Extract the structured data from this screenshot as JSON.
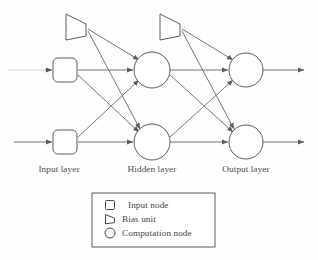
{
  "diagram": {
    "background_color": "#fefefe",
    "stroke_color": "#5c5c5c",
    "faint_stroke_color": "#c9c9c9",
    "layer_labels": [
      {
        "id": "input-layer",
        "text": "Input layer",
        "x": 59,
        "y": 172
      },
      {
        "id": "hidden-layer",
        "text": "Hidden layer",
        "x": 152,
        "y": 172
      },
      {
        "id": "output-layer",
        "text": "Output layer",
        "x": 246,
        "y": 172
      }
    ],
    "nodes": {
      "input": [
        {
          "id": "input-node-1",
          "shape": "rounded-square",
          "cx": 65,
          "cy": 70,
          "size": 24,
          "radius": 5
        },
        {
          "id": "input-node-2",
          "shape": "rounded-square",
          "cx": 65,
          "cy": 142,
          "size": 24,
          "radius": 5
        }
      ],
      "bias": [
        {
          "id": "bias-unit-1",
          "shape": "right-trapezoid",
          "x": 66,
          "y": 14,
          "width": 22,
          "height": 26
        },
        {
          "id": "bias-unit-2",
          "shape": "right-trapezoid",
          "x": 160,
          "y": 14,
          "width": 22,
          "height": 26
        }
      ],
      "hidden": [
        {
          "id": "hidden-node-1",
          "shape": "circle",
          "cx": 152,
          "cy": 70,
          "r": 18
        },
        {
          "id": "hidden-node-2",
          "shape": "circle",
          "cx": 152,
          "cy": 142,
          "r": 18
        }
      ],
      "output": [
        {
          "id": "output-node-1",
          "shape": "circle",
          "cx": 246,
          "cy": 70,
          "r": 17
        },
        {
          "id": "output-node-2",
          "shape": "circle",
          "cx": 246,
          "cy": 142,
          "r": 17
        }
      ]
    },
    "input_arrows": [
      {
        "id": "input-arrow-1",
        "x1": 8,
        "y1": 70,
        "x2": 52,
        "y2": 70,
        "faint": true
      },
      {
        "id": "input-arrow-2",
        "x1": 14,
        "y1": 142,
        "x2": 52,
        "y2": 142,
        "faint": false
      }
    ],
    "output_arrows": [
      {
        "id": "output-arrow-1",
        "x1": 263,
        "y1": 70,
        "x2": 304,
        "y2": 70
      },
      {
        "id": "output-arrow-2",
        "x1": 263,
        "y1": 142,
        "x2": 304,
        "y2": 142
      }
    ],
    "edges": [
      {
        "id": "edge-in1-h1",
        "x1": 78,
        "y1": 70,
        "x2": 134,
        "y2": 70
      },
      {
        "id": "edge-in1-h2",
        "x1": 78,
        "y1": 74,
        "x2": 140,
        "y2": 133
      },
      {
        "id": "edge-in2-h1",
        "x1": 78,
        "y1": 138,
        "x2": 140,
        "y2": 79
      },
      {
        "id": "edge-in2-h2",
        "x1": 78,
        "y1": 142,
        "x2": 134,
        "y2": 142
      },
      {
        "id": "edge-bias1-h1",
        "x1": 88,
        "y1": 30,
        "x2": 140,
        "y2": 61
      },
      {
        "id": "edge-bias1-h2",
        "x1": 88,
        "y1": 31,
        "x2": 141,
        "y2": 131
      },
      {
        "id": "edge-h1-o1",
        "x1": 170,
        "y1": 70,
        "x2": 229,
        "y2": 70
      },
      {
        "id": "edge-h1-o2",
        "x1": 170,
        "y1": 75,
        "x2": 233,
        "y2": 133
      },
      {
        "id": "edge-h2-o1",
        "x1": 170,
        "y1": 137,
        "x2": 233,
        "y2": 79
      },
      {
        "id": "edge-h2-o2",
        "x1": 170,
        "y1": 142,
        "x2": 229,
        "y2": 142
      },
      {
        "id": "edge-bias2-o1",
        "x1": 182,
        "y1": 30,
        "x2": 234,
        "y2": 61
      },
      {
        "id": "edge-bias2-o2",
        "x1": 182,
        "y1": 31,
        "x2": 235,
        "y2": 131
      }
    ],
    "legend": {
      "box": {
        "x": 92,
        "y": 193,
        "width": 123,
        "height": 54
      },
      "items": [
        {
          "id": "legend-input-node",
          "icon": "square-icon",
          "label": "Input node",
          "icon_cx": 110,
          "icon_cy": 205,
          "label_x": 129,
          "label_y": 208
        },
        {
          "id": "legend-bias-unit",
          "icon": "triangle-right-icon",
          "label": "Bias unit",
          "icon_cx": 110,
          "icon_cy": 219,
          "label_x": 123,
          "label_y": 222
        },
        {
          "id": "legend-computation-node",
          "icon": "circle-icon",
          "label": "Computation node",
          "icon_cx": 110,
          "icon_cy": 233,
          "label_x": 123,
          "label_y": 236
        }
      ]
    }
  }
}
